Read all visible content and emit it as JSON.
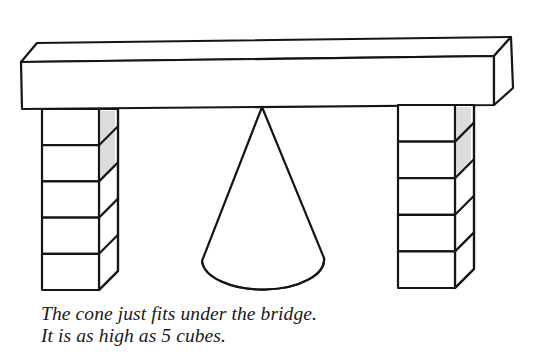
{
  "figure": {
    "objects": {
      "beam": "bridge-beam",
      "left_pillar": {
        "label": "left-cube-pillar",
        "cube_count": 5
      },
      "right_pillar": {
        "label": "right-cube-pillar",
        "cube_count": 5
      },
      "cone": "cone"
    },
    "colors": {
      "ink": "#151515",
      "background": "#ffffff",
      "shading": "#dcdcdc"
    }
  },
  "caption": {
    "line1": "The cone just fits under the bridge.",
    "line2": "It is as high as 5 cubes."
  }
}
